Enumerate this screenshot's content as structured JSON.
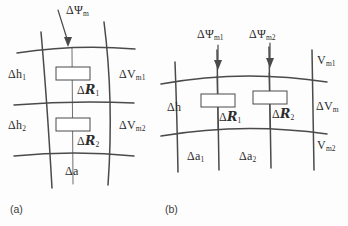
{
  "figure": {
    "background_color": "#fdfdfd",
    "line_color": "#4a4a4a",
    "text_color": "#2b2b2b"
  },
  "panels": [
    {
      "tag": "(a)",
      "id": "panel-a",
      "labels": {
        "flux_top": "ΔΨ",
        "flux_top_sub": "m",
        "height_1": "Δh",
        "height_1_sub": "1",
        "height_2": "Δh",
        "height_2_sub": "2",
        "reluctance_1_delta": "Δ",
        "reluctance_1_symbol": "R",
        "reluctance_1_sub": "1",
        "reluctance_2_delta": "Δ",
        "reluctance_2_symbol": "R",
        "reluctance_2_sub": "2",
        "mmf_1": "ΔV",
        "mmf_1_sub": "m1",
        "mmf_2": "ΔV",
        "mmf_2_sub": "m2",
        "area": "Δa"
      }
    },
    {
      "tag": "(b)",
      "id": "panel-b",
      "labels": {
        "flux_1": "ΔΨ",
        "flux_1_sub": "m1",
        "flux_2": "ΔΨ",
        "flux_2_sub": "m2",
        "height": "Δh",
        "reluctance_1_delta": "Δ",
        "reluctance_1_symbol": "R",
        "reluctance_1_sub": "1",
        "reluctance_2_delta": "Δ",
        "reluctance_2_symbol": "R",
        "reluctance_2_sub": "2",
        "potential_top": "V",
        "potential_top_sub": "m1",
        "mmf": "ΔV",
        "mmf_sub": "m",
        "potential_bottom": "V",
        "potential_bottom_sub": "m2",
        "area_1": "Δa",
        "area_1_sub": "1",
        "area_2": "Δa",
        "area_2_sub": "2"
      }
    }
  ]
}
